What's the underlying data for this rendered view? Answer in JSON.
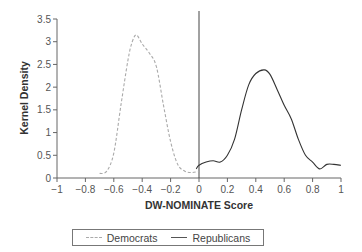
{
  "chart_data": {
    "type": "line",
    "title": "",
    "xlabel": "DW-NOMINATE Score",
    "ylabel": "Kernel Density",
    "xlim": [
      -1,
      1
    ],
    "ylim": [
      0,
      3.5
    ],
    "xticks": [
      "-1",
      "-0.8",
      "-0.6",
      "-0.4",
      "-0.2",
      "0",
      "0.2",
      "0.4",
      "0.6",
      "0.8",
      "1"
    ],
    "yticks": [
      "0",
      "0.5",
      "1",
      "1.5",
      "2",
      "2.5",
      "3",
      "3.5"
    ],
    "grid": false,
    "legend_position": "bottom",
    "reference_line": {
      "x": 0,
      "style": "solid vertical"
    },
    "series": [
      {
        "name": "Democrats",
        "style": "dashed",
        "color": "#aaaaaa",
        "x": [
          -0.7,
          -0.65,
          -0.6,
          -0.55,
          -0.5,
          -0.47,
          -0.44,
          -0.4,
          -0.35,
          -0.3,
          -0.25,
          -0.2,
          -0.15,
          -0.1,
          -0.05,
          0.0
        ],
        "y": [
          0.1,
          0.15,
          0.55,
          1.6,
          2.6,
          3.0,
          3.15,
          2.95,
          2.75,
          2.45,
          1.6,
          0.8,
          0.3,
          0.15,
          0.12,
          0.15
        ]
      },
      {
        "name": "Republicans",
        "style": "solid",
        "color": "#333333",
        "x": [
          -0.02,
          0.0,
          0.05,
          0.1,
          0.15,
          0.2,
          0.25,
          0.3,
          0.35,
          0.4,
          0.46,
          0.5,
          0.55,
          0.6,
          0.65,
          0.7,
          0.75,
          0.8,
          0.85,
          0.9,
          0.95,
          1.0
        ],
        "y": [
          0.2,
          0.28,
          0.35,
          0.38,
          0.35,
          0.5,
          0.85,
          1.5,
          2.05,
          2.3,
          2.38,
          2.28,
          1.95,
          1.6,
          1.3,
          0.85,
          0.5,
          0.35,
          0.2,
          0.3,
          0.3,
          0.28
        ]
      }
    ]
  },
  "legend": {
    "democrats_label": "Democrats",
    "republicans_label": "Republicans"
  },
  "colors": {
    "democrats": "#aaaaaa",
    "republicans": "#333333",
    "axis": "#666666"
  }
}
